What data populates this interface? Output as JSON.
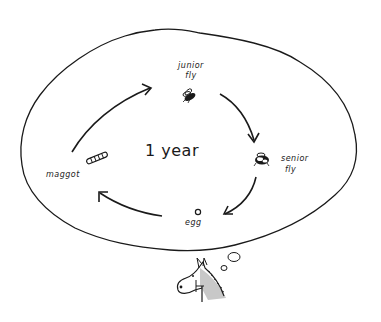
{
  "diagram": {
    "type": "life-cycle thought bubble",
    "center_label": "1 year",
    "stages": [
      {
        "id": "junior-fly",
        "label_line1": "junior",
        "label_line2": "fly",
        "icon": "fly-icon"
      },
      {
        "id": "senior-fly",
        "label_line1": "senior",
        "label_line2": "fly",
        "icon": "fat-fly-icon"
      },
      {
        "id": "egg",
        "label_line1": "egg",
        "icon": "egg-icon"
      },
      {
        "id": "maggot",
        "label_line1": "maggot",
        "icon": "maggot-icon"
      }
    ],
    "arrows": [
      {
        "from": "maggot",
        "to": "junior-fly"
      },
      {
        "from": "junior-fly",
        "to": "senior-fly"
      },
      {
        "from": "senior-fly",
        "to": "egg"
      },
      {
        "from": "egg",
        "to": "maggot"
      }
    ],
    "thinker": "horse-head",
    "colors": {
      "ink": "#1a1a1a",
      "background": "#ffffff",
      "horse_shade": "#c8c8c8"
    }
  }
}
